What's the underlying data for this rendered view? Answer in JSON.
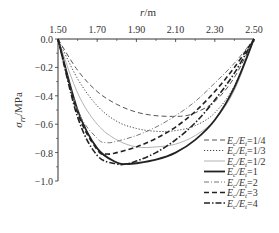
{
  "chart_data": {
    "type": "line",
    "title": "",
    "xlabel": "r/m",
    "ylabel": "σrr/MPa",
    "xlim": [
      1.5,
      2.5
    ],
    "ylim": [
      -1.0,
      0.0
    ],
    "x_ticks": [
      "1.50",
      "1.70",
      "1.90",
      "2.10",
      "2.30",
      "2.50"
    ],
    "y_ticks": [
      "0.0",
      "-0.2",
      "-0.4",
      "-0.6",
      "-0.8",
      "-1.0"
    ],
    "grid": false,
    "legend_position": "lower right",
    "series": [
      {
        "name": "Ec/Et=1/4",
        "style": "dashed-long",
        "color": "#555555",
        "x": [
          1.5,
          1.6,
          1.7,
          1.8,
          1.9,
          2.0,
          2.1,
          2.15,
          2.2,
          2.3,
          2.4,
          2.5
        ],
        "y": [
          0.0,
          -0.22,
          -0.37,
          -0.46,
          -0.515,
          -0.54,
          -0.545,
          -0.54,
          -0.52,
          -0.44,
          -0.27,
          0.0
        ]
      },
      {
        "name": "Ec/Et=1/3",
        "style": "dotted",
        "color": "#444444",
        "x": [
          1.5,
          1.6,
          1.7,
          1.8,
          1.9,
          2.0,
          2.1,
          2.2,
          2.3,
          2.4,
          2.5
        ],
        "y": [
          0.0,
          -0.28,
          -0.47,
          -0.58,
          -0.63,
          -0.65,
          -0.645,
          -0.61,
          -0.52,
          -0.33,
          0.0
        ]
      },
      {
        "name": "Ec/Et=1/2",
        "style": "solid-thin-light",
        "color": "#aaaaaa",
        "x": [
          1.5,
          1.6,
          1.7,
          1.8,
          1.9,
          2.0,
          2.1,
          2.2,
          2.3,
          2.4,
          2.5
        ],
        "y": [
          0.0,
          -0.38,
          -0.6,
          -0.71,
          -0.76,
          -0.76,
          -0.74,
          -0.68,
          -0.57,
          -0.36,
          0.0
        ]
      },
      {
        "name": "Ec/Et=1",
        "style": "solid-thick",
        "color": "#222222",
        "x": [
          1.5,
          1.6,
          1.7,
          1.8,
          1.85,
          1.9,
          2.0,
          2.1,
          2.2,
          2.3,
          2.4,
          2.5
        ],
        "y": [
          0.0,
          -0.5,
          -0.77,
          -0.87,
          -0.88,
          -0.875,
          -0.85,
          -0.8,
          -0.71,
          -0.57,
          -0.34,
          0.0
        ]
      },
      {
        "name": "Ec/Et=2",
        "style": "dash-dot-light",
        "color": "#777777",
        "x": [
          1.5,
          1.6,
          1.7,
          1.75,
          1.8,
          1.9,
          2.0,
          2.1,
          2.2,
          2.3,
          2.4,
          2.5
        ],
        "y": [
          0.0,
          -0.5,
          -0.7,
          -0.73,
          -0.72,
          -0.68,
          -0.62,
          -0.54,
          -0.44,
          -0.31,
          -0.17,
          0.0
        ]
      },
      {
        "name": "Ec/Et=3",
        "style": "dashed-thick",
        "color": "#222222",
        "x": [
          1.5,
          1.6,
          1.7,
          1.75,
          1.8,
          1.9,
          2.0,
          2.1,
          2.2,
          2.3,
          2.4,
          2.5
        ],
        "y": [
          0.0,
          -0.52,
          -0.78,
          -0.81,
          -0.8,
          -0.76,
          -0.7,
          -0.62,
          -0.51,
          -0.37,
          -0.2,
          0.0
        ]
      },
      {
        "name": "Ec/Et=4",
        "style": "dash-dot-thick",
        "color": "#222222",
        "x": [
          1.5,
          1.6,
          1.7,
          1.8,
          1.85,
          1.9,
          2.0,
          2.1,
          2.2,
          2.3,
          2.4,
          2.5
        ],
        "y": [
          0.0,
          -0.55,
          -0.82,
          -0.88,
          -0.88,
          -0.86,
          -0.8,
          -0.71,
          -0.59,
          -0.43,
          -0.24,
          0.0
        ]
      }
    ]
  },
  "legend": {
    "items": [
      {
        "prefix": "E",
        "sub1": "c",
        "mid": "/E",
        "sub2": "t",
        "suffix": "=1/4"
      },
      {
        "prefix": "E",
        "sub1": "c",
        "mid": "/E",
        "sub2": "t",
        "suffix": "=1/3"
      },
      {
        "prefix": "E",
        "sub1": "c",
        "mid": "/E",
        "sub2": "t",
        "suffix": "=1/2"
      },
      {
        "prefix": "E",
        "sub1": "c",
        "mid": "/E",
        "sub2": "t",
        "suffix": "=1"
      },
      {
        "prefix": "E",
        "sub1": "c",
        "mid": "/E",
        "sub2": "t",
        "suffix": "=2"
      },
      {
        "prefix": "E",
        "sub1": "c",
        "mid": "/E",
        "sub2": "t",
        "suffix": "=3"
      },
      {
        "prefix": "E",
        "sub1": "c",
        "mid": "/E",
        "sub2": "t",
        "suffix": "=4"
      }
    ]
  },
  "axes": {
    "x_title_italic": "r",
    "x_title_rest": "/m",
    "y_title_sigma": "σ",
    "y_title_sub": "rr",
    "y_title_rest": "/MPa"
  }
}
